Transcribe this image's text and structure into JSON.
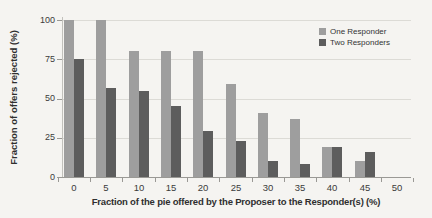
{
  "figure": {
    "background_color": "#f5f4f1",
    "gridline_color": "#dcdbd6",
    "axis_color": "#9a9995",
    "text_color": "#3b3b3b"
  },
  "chart_data": {
    "type": "bar",
    "title": "",
    "xlabel": "Fraction of the pie offered by the Proposer to the Responder(s) (%)",
    "ylabel": "Fraction of offers rejected (%)",
    "categories": [
      "0",
      "5",
      "10",
      "15",
      "20",
      "25",
      "30",
      "35",
      "40",
      "45",
      "50"
    ],
    "series": [
      {
        "name": "One Responder",
        "color": "#9e9e9e",
        "values": [
          100,
          100,
          80,
          80,
          80,
          59,
          41,
          37,
          19,
          10,
          0
        ]
      },
      {
        "name": "Two Responders",
        "color": "#5d5d5d",
        "values": [
          75,
          57,
          55,
          45,
          29,
          23,
          10,
          8,
          19,
          16,
          0
        ]
      }
    ],
    "ylim": [
      0,
      100
    ],
    "yticks": [
      0,
      25,
      50,
      75,
      100
    ],
    "grid": true,
    "legend_position": "top-right"
  }
}
